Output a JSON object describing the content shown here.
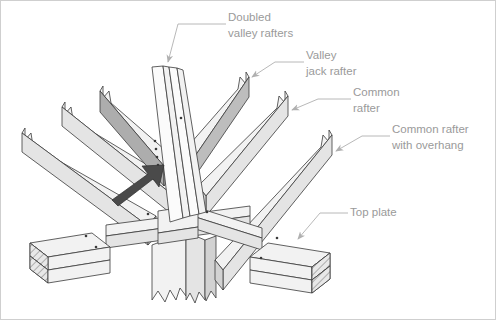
{
  "figure": {
    "type": "isometric-line-drawing",
    "background_color": "#ffffff",
    "label_color": "#9a9a9a",
    "outline_color": "#3a3a3a"
  },
  "labels": [
    {
      "id": "doubled-valley-rafters",
      "line1": "Doubled",
      "line2": "valley rafters",
      "text_x": 228,
      "text_y": 18,
      "points_to": "center converging pair of rafters at apex"
    },
    {
      "id": "valley-jack-rafter",
      "line1": "Valley",
      "line2": "jack rafter",
      "text_x": 306,
      "text_y": 56,
      "points_to": "upper right shaded rafter"
    },
    {
      "id": "common-rafter",
      "line1": "Common",
      "line2": "rafter",
      "text_x": 353,
      "text_y": 93,
      "points_to": "right side rafter with birdsmouth notch"
    },
    {
      "id": "common-rafter-with-overhang",
      "line1": "Common rafter",
      "line2": "with overhang",
      "text_x": 392,
      "text_y": 130,
      "points_to": "outer right rafter extending past plate"
    },
    {
      "id": "top-plate",
      "line1": "Top plate",
      "line2": "",
      "text_x": 350,
      "text_y": 213,
      "points_to": "doubled horizontal plate at lower right"
    }
  ],
  "members": [
    {
      "name": "doubled-valley-rafter-left",
      "role": "valley rafter",
      "shade": "white"
    },
    {
      "name": "doubled-valley-rafter-right",
      "role": "valley rafter",
      "shade": "white"
    },
    {
      "name": "valley-jack-rafter-left",
      "role": "valley jack rafter",
      "shade": "darker"
    },
    {
      "name": "valley-jack-rafter-right",
      "role": "valley jack rafter",
      "shade": "dark"
    },
    {
      "name": "common-rafter-left-outer",
      "role": "common rafter",
      "shade": "top"
    },
    {
      "name": "common-rafter-left-inner",
      "role": "common rafter",
      "shade": "top"
    },
    {
      "name": "common-rafter-right-inner",
      "role": "common rafter",
      "shade": "top"
    },
    {
      "name": "common-rafter-right-outer",
      "role": "common rafter with overhang",
      "shade": "top"
    },
    {
      "name": "top-plate-left",
      "role": "top plate",
      "shade": "top",
      "cut_end": "hatched"
    },
    {
      "name": "top-plate-right",
      "role": "top plate",
      "shade": "top",
      "cut_end": "hatched"
    },
    {
      "name": "top-plate-rail-front",
      "role": "top plate",
      "shade": "top"
    },
    {
      "name": "post-below",
      "role": "supporting members below",
      "shade": "top",
      "break": "zigzag"
    }
  ],
  "annotations": {
    "pointer_arrow": {
      "name": "emphasis-arrow",
      "description": "solid dark arrow pointing up-right to valley rafter joint",
      "color": "#4a4a4a"
    },
    "fasteners": {
      "name": "nail-marks",
      "description": "small dark dots indicating nailing locations",
      "count": 12,
      "color": "#3a3a3a"
    },
    "break_lines": {
      "name": "break-line",
      "description": "zigzag break symbols showing members continue beyond view"
    }
  }
}
